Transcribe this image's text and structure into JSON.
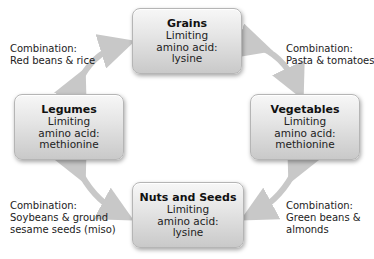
{
  "nodes": [
    {
      "id": "grains",
      "title": "Grains",
      "line1": "Limiting",
      "line2": "amino acid:",
      "line3": "lysine"
    },
    {
      "id": "legumes",
      "title": "Legumes",
      "line1": "Limiting",
      "line2": "amino acid:",
      "line3": "methionine"
    },
    {
      "id": "vegetables",
      "title": "Vegetables",
      "line1": "Limiting",
      "line2": "amino acid:",
      "line3": "methionine"
    },
    {
      "id": "nuts-seeds",
      "title": "Nuts and Seeds",
      "line1": "Limiting",
      "line2": "amino acid:",
      "line3": "lysine"
    }
  ],
  "combinations": [
    {
      "id": "legumes-grains",
      "heading": "Combination:",
      "line1": "Red beans & rice",
      "line2": ""
    },
    {
      "id": "grains-vegetables",
      "heading": "Combination:",
      "line1": "Pasta & tomatoes",
      "line2": ""
    },
    {
      "id": "legumes-nuts",
      "heading": "Combination:",
      "line1": "Soybeans & ground",
      "line2": "sesame seeds (miso)"
    },
    {
      "id": "vegetables-nuts",
      "heading": "Combination:",
      "line1": "Green beans &",
      "line2": "almonds"
    }
  ],
  "colors": {
    "arrow": "#c8c8c8",
    "box_top": "#f7f7f7",
    "box_bottom": "#c9c9c9"
  }
}
